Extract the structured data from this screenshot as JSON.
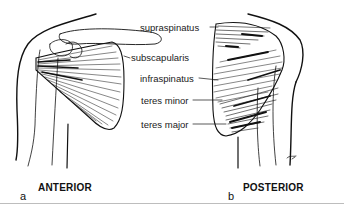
{
  "figure": {
    "labels": {
      "supraspinatus": "supraspinatus",
      "subscapularis": "subscapularis",
      "infraspinatus": "infraspinatus",
      "teres_minor": "teres minor",
      "teres_major": "teres major"
    },
    "panels": {
      "a": {
        "letter": "a",
        "view": "ANTERIOR"
      },
      "b": {
        "letter": "b",
        "view": "POSTERIOR"
      }
    },
    "colors": {
      "ink": "#111111",
      "background": "#ffffff",
      "rule": "#bdbdbd"
    }
  }
}
